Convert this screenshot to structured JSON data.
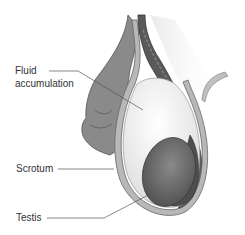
{
  "diagram": {
    "labels": {
      "fluid_line1": "Fluid",
      "fluid_line2": "accumulation",
      "scrotum": "Scrotum",
      "testis": "Testis"
    },
    "colors": {
      "outer_tissue": "#8a8a8a",
      "spermatic_cord": "#5a5a5a",
      "scrotum_wall": "#b8b8b8",
      "fluid": "#f2f2f2",
      "testis": "#6a6a6a",
      "epididymis": "#4e4e4e",
      "leader_line": "#555555",
      "text": "#333333"
    }
  }
}
